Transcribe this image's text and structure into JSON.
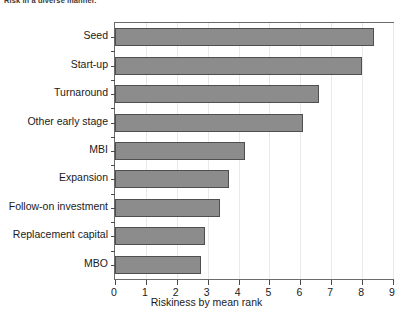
{
  "figure": {
    "caption_fragment": "Risk in a diverse manner.",
    "axis_color": "#6b6b6b",
    "bar_fill": "#8c8c8c",
    "bar_edge": "#4f4f4f",
    "grid_color": "#e9e9e9",
    "background": "#ffffff"
  },
  "chart_data": {
    "type": "bar",
    "orientation": "horizontal",
    "title": "",
    "xlabel": "Riskiness by mean rank",
    "ylabel": "",
    "categories": [
      "Seed",
      "Start-up",
      "Turnaround",
      "Other early stage",
      "MBI",
      "Expansion",
      "Follow-on investment",
      "Replacement capital",
      "MBO"
    ],
    "values": [
      8.4,
      8.0,
      6.6,
      6.1,
      4.2,
      3.7,
      3.4,
      2.9,
      2.8
    ],
    "xlim": [
      0,
      9
    ],
    "xticks": [
      0,
      1,
      2,
      3,
      4,
      5,
      6,
      7,
      8,
      9
    ],
    "xticklabels": [
      "0",
      "1",
      "2",
      "3",
      "4",
      "5",
      "6",
      "7",
      "8",
      "9"
    ],
    "grid": "vertical",
    "legend": "none"
  }
}
